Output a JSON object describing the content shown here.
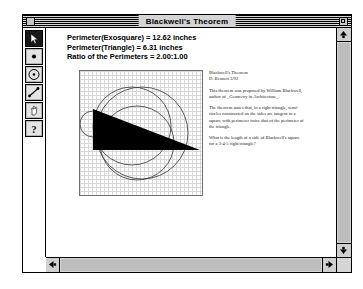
{
  "window": {
    "title": "Blackwell's Theorem",
    "close_box": "close-box",
    "zoom_box": "zoom-box"
  },
  "toolbar": {
    "tools": [
      {
        "name": "arrow-tool",
        "icon": "arrow-icon",
        "selected": true
      },
      {
        "name": "point-tool",
        "icon": "point-icon",
        "selected": false
      },
      {
        "name": "circle-tool",
        "icon": "circle-icon",
        "selected": false
      },
      {
        "name": "segment-tool",
        "icon": "segment-icon",
        "selected": false
      },
      {
        "name": "text-tool",
        "icon": "hand-icon",
        "selected": false
      },
      {
        "name": "help-tool",
        "icon": "question-icon",
        "selected": false
      }
    ]
  },
  "measurements": {
    "line1": "Perimeter(Exosquare) = 12.62 inches",
    "line2": "Perimeter(Triangle) = 6.31 inches",
    "line3": "Ratio of the Perimeters = 2.00:1.00"
  },
  "note": {
    "title": "Blackwell's Theorem",
    "author": "D. Bennett 3/92",
    "paragraph1": "This theorem was proposed by William Blackwell, author of _Geometry in Architecture_.",
    "paragraph2": "The theorem states that, in a right triangle, semi-circles constructed on the sides are tangent to a square with perimeter twice that of the perimeter of the triangle.",
    "paragraph3": "What is the length of a side of Blackwell's square for a 3-4-5 right triangle?"
  },
  "scrollbars": {
    "up_arrow": "scroll-up-arrow",
    "down_arrow": "scroll-down-arrow",
    "left_arrow": "scroll-left-arrow",
    "right_arrow": "scroll-right-arrow"
  },
  "colors": {
    "title_bar": "#d4d4d4",
    "scrollbar": "#d6d6d6",
    "tool_face": "#b6b6b6",
    "tool_selected": "#1a1a1a",
    "figure_fill": "#000000",
    "grid": "#cfcfcf"
  }
}
